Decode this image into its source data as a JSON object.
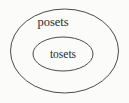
{
  "diagram": {
    "type": "euler-diagram",
    "title": "",
    "background_color": "#fbfbfa",
    "stroke_color": "#4a4a4a",
    "text_color": "#2b2b2b",
    "sets": [
      {
        "id": "outer",
        "label": "posets",
        "shape": "ellipse",
        "center_x": 64.5,
        "center_y": 51,
        "radius_x": 54,
        "radius_y": 42,
        "label_x": 53,
        "label_y": 26,
        "contains": "inner"
      },
      {
        "id": "inner",
        "label": "tosets",
        "shape": "ellipse",
        "center_x": 63,
        "center_y": 54,
        "radius_x": 30,
        "radius_y": 17,
        "label_x": 63,
        "label_y": 58,
        "contains": null
      }
    ],
    "relation": "tosets is a proper subset of posets"
  }
}
